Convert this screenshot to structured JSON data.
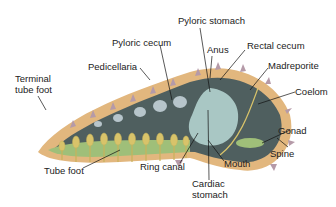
{
  "diagram": {
    "labels": {
      "pyloric_stomach": "Pyloric stomach",
      "pyloric_cecum": "Pyloric cecum",
      "anus": "Anus",
      "rectal_cecum": "Rectal cecum",
      "madreporite": "Madreporite",
      "pedicellaria": "Pedicellaria",
      "terminal_tube_foot": "Terminal\ntube foot",
      "coelom": "Coelom",
      "gonad": "Gonad",
      "spine": "Spine",
      "tube_foot": "Tube foot",
      "ring_canal": "Ring canal",
      "mouth": "Mouth",
      "cardiac_stomach": "Cardiac\nstomach"
    },
    "colors": {
      "body_wall": "#e2b77e",
      "coelom": "#4f5f5f",
      "stomach": "#a9c7c4",
      "tube_feet": "#d8c36a",
      "ampulla_band": "#9fbf79",
      "spines": "#b59aa8",
      "label_text": "#222222",
      "leader_line": "#111111"
    }
  }
}
